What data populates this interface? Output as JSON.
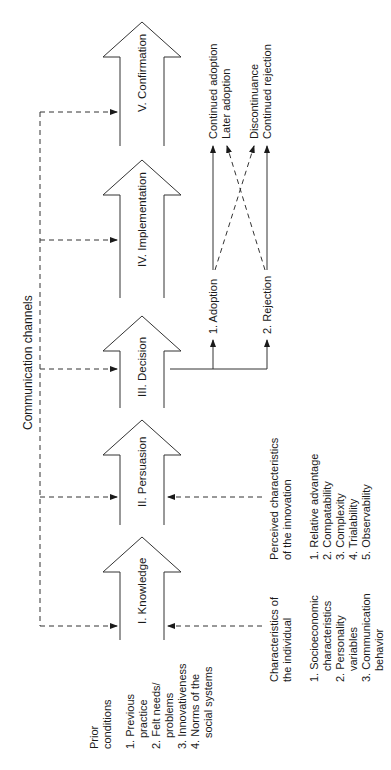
{
  "stages": [
    {
      "label": "I. Knowledge"
    },
    {
      "label": "II. Persuasion"
    },
    {
      "label": "III. Decision"
    },
    {
      "label": "IV. Implementation"
    },
    {
      "label": "V. Confirmation"
    }
  ],
  "communication_channels": {
    "label": "Communication channels"
  },
  "prior_conditions": {
    "title_line1": "Prior",
    "title_line2": "conditions",
    "items": [
      [
        "1. Previous",
        "practice"
      ],
      [
        "2. Felt needs/",
        "problems"
      ],
      [
        "3. Innovativeness"
      ],
      [
        "4. Norms of the",
        "social systems"
      ]
    ]
  },
  "individual_characteristics": {
    "title_line1": "Characteristics of",
    "title_line2": "the individual",
    "items": [
      [
        "1. Socioeconomic",
        "characteristics"
      ],
      [
        "2. Personality",
        "variables"
      ],
      [
        "3. Communication",
        "behavior"
      ]
    ]
  },
  "innovation_characteristics": {
    "title_line1": "Perceived characteristics",
    "title_line2": "of the innovation",
    "items": [
      "1. Relative advantage",
      "2. Compatability",
      "3. Complexity",
      "4. Trialability",
      "5. Observability"
    ]
  },
  "decision_outcomes": {
    "adoption": "1. Adoption",
    "rejection": "2. Rejection"
  },
  "confirmation_outcomes": {
    "continued_adoption": "Continued adoption",
    "later_adoption": "Later adoption",
    "discontinuance": "Discontinuance",
    "continued_rejection": "Continued rejection"
  },
  "colors": {
    "line": "#333333",
    "text": "#1a1a1a",
    "background": "#ffffff"
  }
}
